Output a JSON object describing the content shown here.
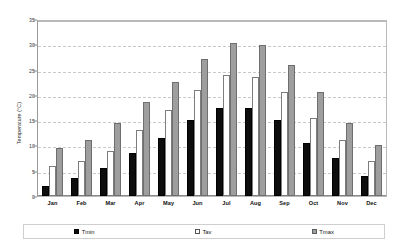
{
  "chart_data": {
    "type": "bar",
    "title": "",
    "subtitle": "",
    "xlabel": "",
    "ylabel": "Temperature (°C)",
    "ylim": [
      0,
      35
    ],
    "ytick_step": 5,
    "yticks": [
      "0",
      "5",
      "10",
      "15",
      "20",
      "25",
      "30",
      "35"
    ],
    "grid": true,
    "grid_style": "dashed-horizontal",
    "legend_position": "bottom",
    "categories": [
      "Jan",
      "Feb",
      "Mar",
      "Apr",
      "May",
      "Jun",
      "Jul",
      "Aug",
      "Sep",
      "Oct",
      "Nov",
      "Dec"
    ],
    "series": [
      {
        "name": "Tmin",
        "color": "#0d0d0d",
        "values": [
          2.0,
          3.5,
          5.5,
          8.5,
          11.5,
          15.0,
          17.5,
          17.5,
          15.0,
          10.5,
          7.5,
          4.0
        ]
      },
      {
        "name": "Tav",
        "color": "#ffffff",
        "values": [
          6.0,
          7.0,
          9.0,
          13.0,
          17.0,
          21.0,
          24.0,
          23.5,
          20.5,
          15.5,
          11.0,
          7.0
        ]
      },
      {
        "name": "Tmax",
        "color": "#9e9e9e",
        "values": [
          9.5,
          11.0,
          14.5,
          18.5,
          22.5,
          27.0,
          30.3,
          29.8,
          26.0,
          20.5,
          14.5,
          10.0
        ]
      }
    ]
  },
  "legend": {
    "items": [
      {
        "label": "Tmin",
        "swatch": "black-square-icon"
      },
      {
        "label": "Tav",
        "swatch": "white-square-icon"
      },
      {
        "label": "Tmax",
        "swatch": "gray-square-icon"
      }
    ]
  }
}
